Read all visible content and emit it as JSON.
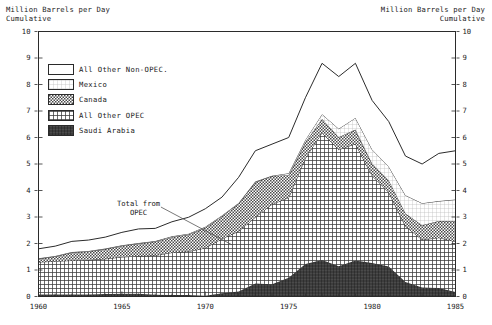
{
  "axis": {
    "left_title_line1": "Million Barrels per Day",
    "left_title_line2": "Cumulative",
    "right_title_line1": "Million Barrels per Day",
    "right_title_line2": "Cumulative",
    "y_ticks": [
      "0",
      "1",
      "2",
      "3",
      "4",
      "5",
      "6",
      "7",
      "8",
      "9",
      "10"
    ],
    "x_ticks": [
      "1960",
      "1965",
      "1970",
      "1975",
      "1980",
      "1985"
    ]
  },
  "legend": {
    "items": [
      {
        "label": "All Other Non-OPEC.",
        "pattern": "blank",
        "color": "#ffffff"
      },
      {
        "label": "Mexico",
        "pattern": "fine-grid",
        "color": "#efefef"
      },
      {
        "label": "Canada",
        "pattern": "checker",
        "color": "#9a9a9a"
      },
      {
        "label": "All Other OPEC",
        "pattern": "cross-hatch",
        "color": "#6e6e6e"
      },
      {
        "label": "Saudi Arabia",
        "pattern": "dense-dark",
        "color": "#4a4a4a"
      }
    ]
  },
  "annotation": {
    "line1": "Total from",
    "line2": "OPEC"
  },
  "chart_data": {
    "type": "area",
    "xlabel": "",
    "ylabel": "Million Barrels per Day Cumulative",
    "xlim": [
      1960,
      1985
    ],
    "ylim": [
      0,
      10
    ],
    "grid": false,
    "legend_position": "upper-left-inside",
    "stacked": true,
    "annotations": [
      {
        "text": "Total from OPEC",
        "x": 1966.5,
        "y": 3.15,
        "points_to": {
          "x": 1971.6,
          "y": 1.95
        }
      }
    ],
    "x": [
      1960,
      1961,
      1962,
      1963,
      1964,
      1965,
      1966,
      1967,
      1968,
      1969,
      1970,
      1971,
      1972,
      1973,
      1974,
      1975,
      1976,
      1977,
      1978,
      1979,
      1980,
      1981,
      1982,
      1983,
      1984,
      1985
    ],
    "series": [
      {
        "name": "Saudi Arabia",
        "order": 1,
        "values": [
          0.08,
          0.08,
          0.08,
          0.08,
          0.09,
          0.1,
          0.1,
          0.07,
          0.06,
          0.06,
          0.03,
          0.12,
          0.19,
          0.49,
          0.46,
          0.71,
          1.23,
          1.38,
          1.14,
          1.36,
          1.26,
          1.13,
          0.55,
          0.34,
          0.32,
          0.17
        ]
      },
      {
        "name": "All Other OPEC",
        "order": 2,
        "values": [
          1.22,
          1.25,
          1.28,
          1.3,
          1.33,
          1.39,
          1.43,
          1.48,
          1.6,
          1.64,
          1.8,
          2.06,
          2.27,
          2.5,
          3.02,
          3.02,
          3.99,
          4.8,
          4.4,
          4.4,
          3.3,
          2.8,
          2.1,
          1.8,
          1.9,
          1.9
        ]
      },
      {
        "name": "Canada",
        "order": 3,
        "values": [
          0.12,
          0.18,
          0.3,
          0.32,
          0.37,
          0.42,
          0.47,
          0.52,
          0.58,
          0.64,
          0.76,
          0.85,
          1.05,
          1.33,
          1.07,
          0.85,
          0.6,
          0.52,
          0.47,
          0.54,
          0.46,
          0.45,
          0.48,
          0.55,
          0.63,
          0.77
        ]
      },
      {
        "name": "Mexico",
        "order": 4,
        "values": [
          0.02,
          0.02,
          0.02,
          0.02,
          0.02,
          0.02,
          0.02,
          0.02,
          0.03,
          0.03,
          0.04,
          0.03,
          0.02,
          0.02,
          0.01,
          0.07,
          0.09,
          0.18,
          0.32,
          0.44,
          0.53,
          0.52,
          0.69,
          0.83,
          0.75,
          0.82
        ]
      },
      {
        "name": "All Other Non-OPEC.",
        "order": 5,
        "values": [
          0.36,
          0.37,
          0.4,
          0.41,
          0.43,
          0.49,
          0.53,
          0.48,
          0.55,
          0.62,
          0.68,
          0.69,
          0.97,
          1.16,
          1.19,
          1.35,
          1.59,
          1.92,
          1.97,
          2.06,
          1.85,
          1.7,
          1.48,
          1.48,
          1.8,
          1.84
        ]
      }
    ],
    "total_series": {
      "name": "Total imports",
      "values": [
        1.8,
        1.9,
        2.08,
        2.13,
        2.24,
        2.42,
        2.55,
        2.57,
        2.82,
        2.99,
        3.31,
        3.75,
        4.5,
        5.5,
        5.75,
        6.0,
        7.5,
        8.8,
        8.3,
        8.8,
        7.4,
        6.6,
        5.3,
        5.0,
        5.4,
        5.5
      ]
    },
    "opec_total": {
      "name": "Total from OPEC",
      "values": [
        1.3,
        1.33,
        1.36,
        1.38,
        1.42,
        1.49,
        1.53,
        1.55,
        1.66,
        1.7,
        1.83,
        2.18,
        2.46,
        2.99,
        3.48,
        3.73,
        5.22,
        6.18,
        5.54,
        5.76,
        4.56,
        3.93,
        2.65,
        2.14,
        2.22,
        2.07
      ]
    }
  }
}
